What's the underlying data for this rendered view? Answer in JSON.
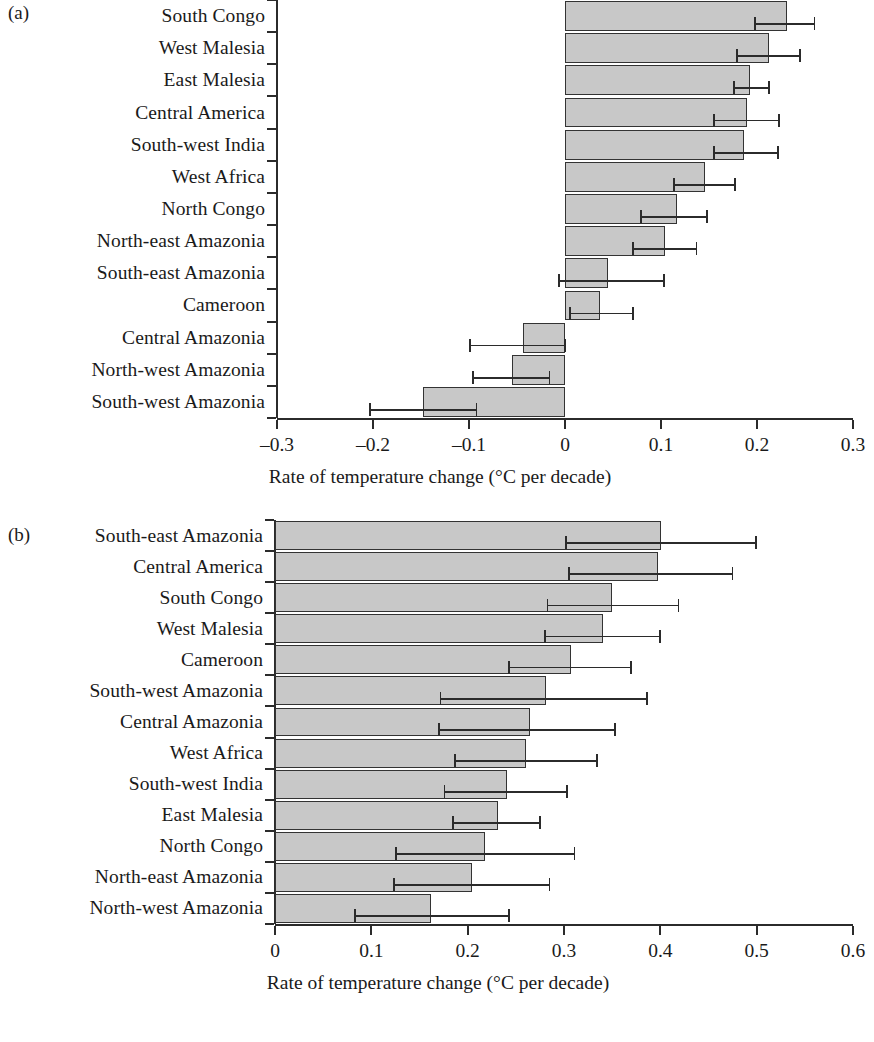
{
  "figure": {
    "background_color": "#ffffff",
    "bar_fill_color": "#c8c8c8",
    "bar_edge_color": "#333333",
    "axis_color": "#2b2b2b"
  },
  "panels": [
    {
      "tag": "(a)"
    },
    {
      "tag": "(b)"
    }
  ],
  "chart_data": [
    {
      "type": "bar",
      "orientation": "horizontal",
      "panel": "(a)",
      "title": "",
      "xlabel": "Rate of temperature change (°C per decade)",
      "ylabel": "",
      "xlim": [
        -0.3,
        0.3
      ],
      "xticks": [
        -0.3,
        -0.2,
        -0.1,
        0,
        0.1,
        0.2,
        0.3
      ],
      "xticklabels": [
        "–0.3",
        "–0.2",
        "–0.1",
        "0",
        "0.1",
        "0.2",
        "0.3"
      ],
      "grid": false,
      "legend": false,
      "error_bars": "asymmetric horizontal with caps",
      "categories": [
        "South Congo",
        "West Malesia",
        "East Malesia",
        "Central America",
        "South-west India",
        "West Africa",
        "North Congo",
        "North-east Amazonia",
        "South-east Amazonia",
        "Cameroon",
        "Central Amazonia",
        "North-west Amazonia",
        "South-west Amazonia"
      ],
      "values": [
        0.231,
        0.212,
        0.193,
        0.19,
        0.186,
        0.183,
        0.146,
        0.117,
        0.104,
        0.045,
        0.036,
        -0.044,
        -0.055,
        -0.148
      ],
      "series": [
        {
          "name": "Rate of temperature change",
          "values": [
            0.231,
            0.212,
            0.193,
            0.19,
            0.186,
            0.183,
            0.146,
            0.117,
            0.104,
            0.045,
            0.036,
            -0.044,
            -0.055,
            -0.148
          ],
          "err_low": [
            0.198,
            0.179,
            0.176,
            0.155,
            0.155,
            0.152,
            0.114,
            0.079,
            0.071,
            -0.006,
            0.005,
            -0.099,
            -0.096,
            -0.203
          ],
          "err_high": [
            0.26,
            0.245,
            0.213,
            0.223,
            0.222,
            0.217,
            0.177,
            0.148,
            0.137,
            0.103,
            0.071,
            0.0,
            -0.016,
            -0.092
          ]
        }
      ],
      "bars": [
        {
          "category": "South Congo",
          "value": 0.231,
          "err_low": 0.198,
          "err_high": 0.26
        },
        {
          "category": "West Malesia",
          "value": 0.212,
          "err_low": 0.179,
          "err_high": 0.245
        },
        {
          "category": "East Malesia",
          "value": 0.193,
          "err_low": 0.176,
          "err_high": 0.213
        },
        {
          "category": "Central America",
          "value": 0.19,
          "err_low": 0.155,
          "err_high": 0.223
        },
        {
          "category": "South-west India",
          "value": 0.186,
          "err_low": 0.155,
          "err_high": 0.222
        },
        {
          "category": "West Africa",
          "value": 0.146,
          "err_low": 0.114,
          "err_high": 0.177
        },
        {
          "category": "North Congo",
          "value": 0.117,
          "err_low": 0.079,
          "err_high": 0.148
        },
        {
          "category": "North-east Amazonia",
          "value": 0.104,
          "err_low": 0.071,
          "err_high": 0.137
        },
        {
          "category": "South-east Amazonia",
          "value": 0.045,
          "err_low": -0.006,
          "err_high": 0.103
        },
        {
          "category": "Cameroon",
          "value": 0.036,
          "err_low": 0.005,
          "err_high": 0.071
        },
        {
          "category": "Central Amazonia",
          "value": -0.044,
          "err_low": -0.099,
          "err_high": 0.0
        },
        {
          "category": "North-west Amazonia",
          "value": -0.055,
          "err_low": -0.096,
          "err_high": -0.016
        },
        {
          "category": "South-west Amazonia",
          "value": -0.148,
          "err_low": -0.203,
          "err_high": -0.092
        }
      ]
    },
    {
      "type": "bar",
      "orientation": "horizontal",
      "panel": "(b)",
      "title": "",
      "xlabel": "Rate of temperature change (°C per decade)",
      "ylabel": "",
      "xlim": [
        0,
        0.6
      ],
      "xticks": [
        0,
        0.1,
        0.2,
        0.3,
        0.4,
        0.5,
        0.6
      ],
      "xticklabels": [
        "0",
        "0.1",
        "0.2",
        "0.3",
        "0.4",
        "0.5",
        "0.6"
      ],
      "grid": false,
      "legend": false,
      "error_bars": "asymmetric horizontal with caps",
      "categories": [
        "South-east Amazonia",
        "Central America",
        "South Congo",
        "West Malesia",
        "Cameroon",
        "South-west Amazonia",
        "Central Amazonia",
        "West Africa",
        "South-west India",
        "East Malesia",
        "North Congo",
        "North-east Amazonia",
        "North-west Amazonia"
      ],
      "values": [
        0.401,
        0.398,
        0.35,
        0.341,
        0.307,
        0.281,
        0.265,
        0.261,
        0.241,
        0.231,
        0.218,
        0.205,
        0.162
      ],
      "series": [
        {
          "name": "Rate of temperature change",
          "values": [
            0.401,
            0.398,
            0.35,
            0.341,
            0.307,
            0.281,
            0.265,
            0.261,
            0.241,
            0.231,
            0.218,
            0.205,
            0.162
          ],
          "err_low": [
            0.302,
            0.305,
            0.283,
            0.28,
            0.243,
            0.172,
            0.17,
            0.187,
            0.176,
            0.185,
            0.126,
            0.124,
            0.083
          ],
          "err_high": [
            0.499,
            0.475,
            0.419,
            0.4,
            0.37,
            0.386,
            0.353,
            0.334,
            0.303,
            0.275,
            0.311,
            0.285,
            0.243
          ]
        }
      ],
      "bars": [
        {
          "category": "South-east Amazonia",
          "value": 0.401,
          "err_low": 0.302,
          "err_high": 0.499
        },
        {
          "category": "Central America",
          "value": 0.398,
          "err_low": 0.305,
          "err_high": 0.475
        },
        {
          "category": "South Congo",
          "value": 0.35,
          "err_low": 0.283,
          "err_high": 0.419
        },
        {
          "category": "West Malesia",
          "value": 0.341,
          "err_low": 0.28,
          "err_high": 0.4
        },
        {
          "category": "Cameroon",
          "value": 0.307,
          "err_low": 0.243,
          "err_high": 0.37
        },
        {
          "category": "South-west Amazonia",
          "value": 0.281,
          "err_low": 0.172,
          "err_high": 0.386
        },
        {
          "category": "Central Amazonia",
          "value": 0.265,
          "err_low": 0.17,
          "err_high": 0.353
        },
        {
          "category": "West Africa",
          "value": 0.261,
          "err_low": 0.187,
          "err_high": 0.334
        },
        {
          "category": "South-west India",
          "value": 0.241,
          "err_low": 0.176,
          "err_high": 0.303
        },
        {
          "category": "East Malesia",
          "value": 0.231,
          "err_low": 0.185,
          "err_high": 0.275
        },
        {
          "category": "North Congo",
          "value": 0.218,
          "err_low": 0.126,
          "err_high": 0.311
        },
        {
          "category": "North-east Amazonia",
          "value": 0.205,
          "err_low": 0.124,
          "err_high": 0.285
        },
        {
          "category": "North-west Amazonia",
          "value": 0.162,
          "err_low": 0.083,
          "err_high": 0.243
        }
      ]
    }
  ]
}
